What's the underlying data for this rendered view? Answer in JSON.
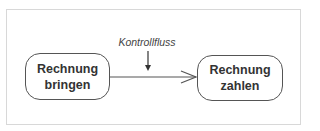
{
  "diagram": {
    "type": "uml-activity",
    "nodes": [
      {
        "id": "rechnung-bringen",
        "line1": "Rechnung",
        "line2": "bringen"
      },
      {
        "id": "rechnung-zahlen",
        "line1": "Rechnung",
        "line2": "zahlen"
      }
    ],
    "edges": [
      {
        "from": "rechnung-bringen",
        "to": "rechnung-zahlen",
        "arrowhead": "open"
      }
    ],
    "annotation": {
      "text": "Kontrollfluss",
      "points_to": "edge"
    },
    "colors": {
      "stroke": "#555555",
      "frame": "#d8d8d8",
      "text": "#333333"
    }
  }
}
